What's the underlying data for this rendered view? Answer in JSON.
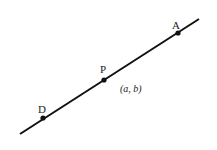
{
  "diagram": {
    "line": {
      "x1": 20,
      "y1": 134,
      "x2": 199,
      "y2": 19,
      "color": "#111111"
    },
    "points": [
      {
        "label": "A",
        "x": 178,
        "y": 33,
        "label_x": 172,
        "label_y": 29
      },
      {
        "label": "P",
        "x": 104,
        "y": 80,
        "label_x": 100,
        "label_y": 73
      },
      {
        "label": "D",
        "x": 43,
        "y": 118,
        "label_x": 38,
        "label_y": 113
      }
    ],
    "coordinate_label": {
      "text": "(a, b)",
      "x": 120,
      "y": 92
    }
  }
}
